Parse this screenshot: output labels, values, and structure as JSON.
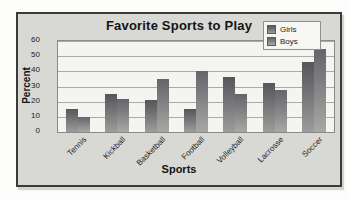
{
  "figure": {
    "title": "Favorite Sports to Play",
    "x_axis_label": "Sports",
    "y_axis_label": "Percent",
    "background": "#d8d8d4",
    "plot_background": "#f4f4f1",
    "border_color": "#3a3a3a"
  },
  "legend": {
    "entries": [
      "Girls",
      "Boys"
    ],
    "position": "top-right"
  },
  "chart_data": {
    "type": "bar",
    "title": "Favorite Sports to Play",
    "xlabel": "Sports",
    "ylabel": "Percent",
    "categories": [
      "Tennis",
      "Kickball",
      "Basketball",
      "Football",
      "Volleyball",
      "Lacrosse",
      "Soccer"
    ],
    "series": [
      {
        "name": "Girls",
        "values": [
          15,
          25,
          21,
          15,
          36,
          32,
          46
        ],
        "color_top": "#55555b",
        "color_bottom": "#9c9c9a"
      },
      {
        "name": "Boys",
        "values": [
          10,
          22,
          35,
          40,
          25,
          28,
          55
        ],
        "color_top": "#64646b",
        "color_bottom": "#a7a7a4"
      }
    ],
    "ylim": [
      0,
      60
    ],
    "yticks": [
      0,
      10,
      20,
      30,
      40,
      50,
      60
    ],
    "grid": true,
    "legend_position": "top-right"
  }
}
